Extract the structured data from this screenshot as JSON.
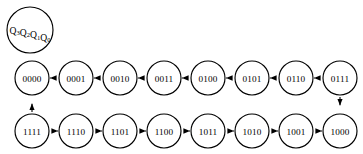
{
  "diagram": {
    "legend": {
      "name": "state-register-legend",
      "base": "Q",
      "subscripts": [
        "3",
        "2",
        "1",
        "0"
      ],
      "text": "Q3Q2Q1Q0",
      "cx": 30,
      "cy": 30,
      "r": 23
    },
    "style": {
      "stroke_color": "#000000",
      "fill_color": "#ffffff",
      "background": "#ffffff",
      "node_radius": 17,
      "row_top_y": 78,
      "row_bottom_y": 131,
      "first_cx": 32,
      "spacing": 44
    },
    "rows": {
      "top": {
        "direction": "left-to-right",
        "states": [
          "0000",
          "0001",
          "0010",
          "0011",
          "0100",
          "0101",
          "0110",
          "0111"
        ]
      },
      "bottom": {
        "direction": "right-to-left",
        "states": [
          "1111",
          "1110",
          "1101",
          "1100",
          "1011",
          "1010",
          "1001",
          "1000"
        ]
      }
    },
    "transitions": [
      {
        "from": "0000",
        "to": "0001"
      },
      {
        "from": "0001",
        "to": "0010"
      },
      {
        "from": "0010",
        "to": "0011"
      },
      {
        "from": "0011",
        "to": "0100"
      },
      {
        "from": "0100",
        "to": "0101"
      },
      {
        "from": "0101",
        "to": "0110"
      },
      {
        "from": "0110",
        "to": "0111"
      },
      {
        "from": "0111",
        "to": "1000"
      },
      {
        "from": "1000",
        "to": "1001"
      },
      {
        "from": "1001",
        "to": "1010"
      },
      {
        "from": "1010",
        "to": "1011"
      },
      {
        "from": "1011",
        "to": "1100"
      },
      {
        "from": "1100",
        "to": "1101"
      },
      {
        "from": "1101",
        "to": "1110"
      },
      {
        "from": "1110",
        "to": "1111"
      },
      {
        "from": "1111",
        "to": "0000"
      }
    ]
  }
}
